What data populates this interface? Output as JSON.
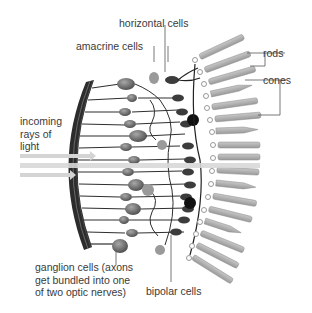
{
  "labels": {
    "horizontal_cells": "horizontal cells",
    "amacrine_cells": "amacrine cells",
    "rods": "rods",
    "cones": "cones",
    "incoming_light": [
      "incoming",
      "rays of",
      "light"
    ],
    "ganglion_cells": [
      "ganglion cells (axons",
      "get bundled into one",
      "of two optic nerves)"
    ],
    "bipolar_cells": "bipolar cells"
  },
  "colors": {
    "text": "#3a3a3a",
    "leader_line": "#555555",
    "light_ray": "#d4d4d4",
    "nerve_fiber": "#2f2f2f",
    "cell_body": "#6f6f6f",
    "photoreceptor": "#b5b5b5"
  }
}
